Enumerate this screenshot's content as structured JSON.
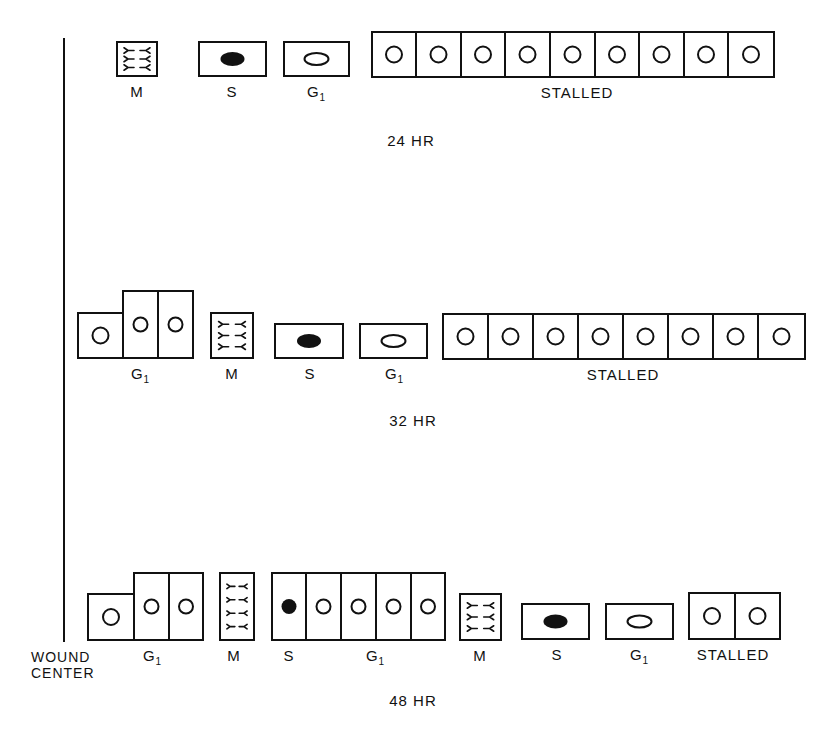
{
  "diagram": {
    "stroke_color": "#111111",
    "axis_label": [
      "WOUND",
      "CENTER"
    ],
    "axis": {
      "x": 64,
      "y1": 38,
      "y2": 642
    },
    "rows": [
      {
        "time_label": "24 HR",
        "time_pos": [
          411,
          132
        ],
        "groups": [
          {
            "label": "M",
            "sub": "",
            "label_x": 137,
            "cells": [
              {
                "x": 117,
                "y": 42,
                "w": 40,
                "h": 34,
                "type": "mitosis-horizontal"
              }
            ]
          },
          {
            "label": "S",
            "sub": "",
            "label_x": 232,
            "cells": [
              {
                "x": 199,
                "y": 42,
                "w": 67,
                "h": 34,
                "type": "s-phase"
              }
            ]
          },
          {
            "label": "G",
            "sub": "1",
            "label_x": 316,
            "cells": [
              {
                "x": 284,
                "y": 42,
                "w": 65,
                "h": 34,
                "type": "g1-oval"
              }
            ]
          },
          {
            "label": "STALLED",
            "sub": "",
            "label_x": 577,
            "cells": [
              {
                "x": 372,
                "y": 32,
                "w": 44,
                "h": 45,
                "type": "round"
              },
              {
                "x": 416,
                "y": 32,
                "w": 45,
                "h": 45,
                "type": "round"
              },
              {
                "x": 461,
                "y": 32,
                "w": 44,
                "h": 45,
                "type": "round"
              },
              {
                "x": 505,
                "y": 32,
                "w": 45,
                "h": 45,
                "type": "round"
              },
              {
                "x": 550,
                "y": 32,
                "w": 45,
                "h": 45,
                "type": "round"
              },
              {
                "x": 595,
                "y": 32,
                "w": 44,
                "h": 45,
                "type": "round"
              },
              {
                "x": 639,
                "y": 32,
                "w": 45,
                "h": 45,
                "type": "round"
              },
              {
                "x": 684,
                "y": 32,
                "w": 44,
                "h": 45,
                "type": "round"
              },
              {
                "x": 728,
                "y": 32,
                "w": 46,
                "h": 45,
                "type": "round"
              }
            ]
          }
        ]
      },
      {
        "time_label": "32 HR",
        "time_pos": [
          413,
          412
        ],
        "groups": [
          {
            "label": "G",
            "sub": "1",
            "label_x": 140,
            "cells": [
              {
                "x": 78,
                "y": 313,
                "w": 45,
                "h": 45,
                "type": "round"
              },
              {
                "x": 123,
                "y": 291,
                "w": 35,
                "h": 67,
                "type": "round-small"
              },
              {
                "x": 158,
                "y": 291,
                "w": 35,
                "h": 67,
                "type": "round-small"
              }
            ]
          },
          {
            "label": "M",
            "sub": "",
            "label_x": 232,
            "cells": [
              {
                "x": 211,
                "y": 313,
                "w": 42,
                "h": 45,
                "type": "mitosis-horizontal"
              }
            ]
          },
          {
            "label": "S",
            "sub": "",
            "label_x": 310,
            "cells": [
              {
                "x": 275,
                "y": 324,
                "w": 68,
                "h": 34,
                "type": "s-phase"
              }
            ]
          },
          {
            "label": "G",
            "sub": "1",
            "label_x": 394,
            "cells": [
              {
                "x": 360,
                "y": 324,
                "w": 67,
                "h": 34,
                "type": "g1-oval"
              }
            ]
          },
          {
            "label": "STALLED",
            "sub": "",
            "label_x": 623,
            "cells": [
              {
                "x": 443,
                "y": 314,
                "w": 45,
                "h": 45,
                "type": "round"
              },
              {
                "x": 488,
                "y": 314,
                "w": 45,
                "h": 45,
                "type": "round"
              },
              {
                "x": 533,
                "y": 314,
                "w": 45,
                "h": 45,
                "type": "round"
              },
              {
                "x": 578,
                "y": 314,
                "w": 45,
                "h": 45,
                "type": "round"
              },
              {
                "x": 623,
                "y": 314,
                "w": 45,
                "h": 45,
                "type": "round"
              },
              {
                "x": 668,
                "y": 314,
                "w": 45,
                "h": 45,
                "type": "round"
              },
              {
                "x": 713,
                "y": 314,
                "w": 45,
                "h": 45,
                "type": "round"
              },
              {
                "x": 758,
                "y": 314,
                "w": 47,
                "h": 45,
                "type": "round"
              }
            ]
          }
        ]
      },
      {
        "time_label": "48 HR",
        "time_pos": [
          413,
          692
        ],
        "groups": [
          {
            "label": "G",
            "sub": "1",
            "label_x": 152,
            "cells": [
              {
                "x": 88,
                "y": 594,
                "w": 46,
                "h": 46,
                "type": "round"
              },
              {
                "x": 134,
                "y": 573,
                "w": 35,
                "h": 67,
                "type": "round-small"
              },
              {
                "x": 169,
                "y": 573,
                "w": 34,
                "h": 67,
                "type": "round-small"
              }
            ]
          },
          {
            "label": "M",
            "sub": "",
            "label_x": 234,
            "cells": [
              {
                "x": 220,
                "y": 573,
                "w": 34,
                "h": 67,
                "type": "mitosis-vertical"
              }
            ]
          },
          {
            "label": "S",
            "sub": "",
            "label_x": 289,
            "cells": [
              {
                "x": 272,
                "y": 573,
                "w": 34,
                "h": 67,
                "type": "s-small"
              }
            ]
          },
          {
            "label": "G",
            "sub": "1",
            "label_x": 375,
            "cells": [
              {
                "x": 306,
                "y": 573,
                "w": 35,
                "h": 67,
                "type": "round-small"
              },
              {
                "x": 341,
                "y": 573,
                "w": 35,
                "h": 67,
                "type": "round-small"
              },
              {
                "x": 376,
                "y": 573,
                "w": 35,
                "h": 67,
                "type": "round-small"
              },
              {
                "x": 411,
                "y": 573,
                "w": 34,
                "h": 67,
                "type": "round-small"
              }
            ]
          },
          {
            "label": "M",
            "sub": "",
            "label_x": 480,
            "cells": [
              {
                "x": 460,
                "y": 594,
                "w": 41,
                "h": 46,
                "type": "mitosis-horizontal"
              }
            ]
          },
          {
            "label": "S",
            "sub": "",
            "label_x": 557,
            "cells": [
              {
                "x": 522,
                "y": 604,
                "w": 67,
                "h": 35,
                "type": "s-phase"
              }
            ]
          },
          {
            "label": "G",
            "sub": "1",
            "label_x": 639,
            "cells": [
              {
                "x": 606,
                "y": 604,
                "w": 67,
                "h": 35,
                "type": "g1-oval"
              }
            ]
          },
          {
            "label": "STALLED",
            "sub": "",
            "label_x": 733,
            "cells": [
              {
                "x": 689,
                "y": 593,
                "w": 46,
                "h": 46,
                "type": "round"
              },
              {
                "x": 735,
                "y": 593,
                "w": 45,
                "h": 46,
                "type": "round"
              }
            ]
          }
        ]
      }
    ]
  }
}
